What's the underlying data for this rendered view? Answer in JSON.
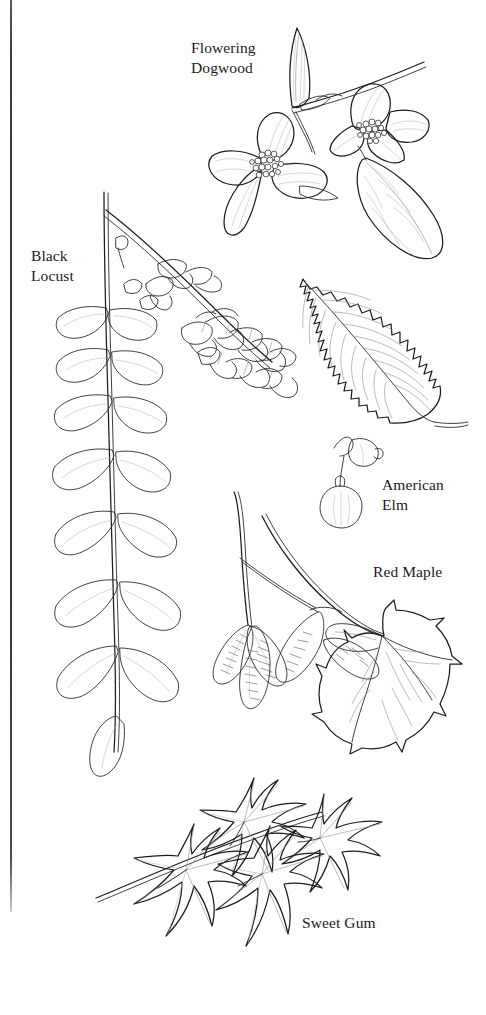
{
  "page": {
    "kind": "botanical-identification-plate",
    "background_color": "#ffffff",
    "ink_color": "#2b2b2b",
    "width": 486,
    "height": 1015,
    "binding_edge_color": "#333333"
  },
  "specimens": [
    {
      "id": "flowering-dogwood",
      "label": "Flowering\nDogwood",
      "label_lines": [
        "Flowering",
        "Dogwood"
      ],
      "drawing": "branch with two four-bracted dogwood flowers, dense button-like flower centers, and ovate leaves"
    },
    {
      "id": "black-locust",
      "label": "Black\nLocust",
      "label_lines": [
        "Black",
        "Locust"
      ],
      "drawing": "pinnately compound leaf with paired oval leaflets and a drooping raceme of pea-like flowers"
    },
    {
      "id": "american-elm",
      "label": "American\nElm",
      "label_lines": [
        "American",
        "Elm"
      ],
      "drawing": "single doubly-serrate asymmetric leaf with pinnate veins, plus two small samaras on stalks"
    },
    {
      "id": "red-maple",
      "label": "Red Maple",
      "label_lines": [
        "Red Maple"
      ],
      "drawing": "twig with paired winged samaras on long stalks and a three-lobed serrate leaf"
    },
    {
      "id": "sweet-gum",
      "label": "Sweet Gum",
      "label_lines": [
        "Sweet Gum"
      ],
      "drawing": "branch bearing four star-shaped five-lobed palmate leaves"
    }
  ]
}
